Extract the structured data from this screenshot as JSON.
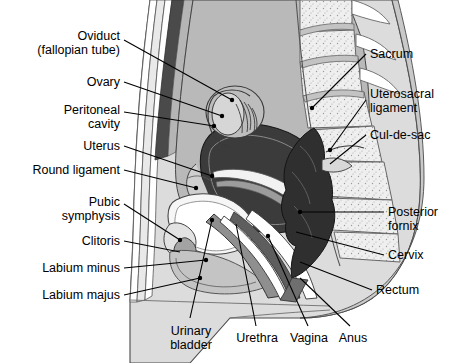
{
  "figure": {
    "type": "anatomical-diagram",
    "style": "grayscale line illustration with leader lines",
    "background_color": "#ffffff",
    "line_color": "#000000",
    "width": 463,
    "height": 363
  },
  "labels": {
    "left": [
      {
        "id": "oviduct",
        "text": "Oviduct\n(fallopian tube)",
        "align": "right",
        "x": 8,
        "y": 30,
        "w": 112
      },
      {
        "id": "ovary",
        "text": "Ovary",
        "align": "right",
        "x": 8,
        "y": 76,
        "w": 112
      },
      {
        "id": "peritoneal-cavity",
        "text": "Peritoneal\ncavity",
        "align": "right",
        "x": 8,
        "y": 104,
        "w": 112
      },
      {
        "id": "uterus",
        "text": "Uterus",
        "align": "right",
        "x": 8,
        "y": 140,
        "w": 112
      },
      {
        "id": "round-ligament",
        "text": "Round ligament",
        "align": "right",
        "x": 4,
        "y": 164,
        "w": 116
      },
      {
        "id": "pubic-symphysis",
        "text": "Pubic\nsymphysis",
        "align": "right",
        "x": 8,
        "y": 196,
        "w": 112
      },
      {
        "id": "clitoris",
        "text": "Clitoris",
        "align": "right",
        "x": 8,
        "y": 235,
        "w": 112
      },
      {
        "id": "labium-minus",
        "text": "Labium minus",
        "align": "right",
        "x": 8,
        "y": 262,
        "w": 112
      },
      {
        "id": "labium-majus",
        "text": "Labium majus",
        "align": "right",
        "x": 8,
        "y": 289,
        "w": 112
      }
    ],
    "right": [
      {
        "id": "sacrum",
        "text": "Sacrum",
        "align": "left",
        "x": 370,
        "y": 48,
        "w": 92
      },
      {
        "id": "uterosacral-ligament",
        "text": "Uterosacral\nligament",
        "align": "left",
        "x": 370,
        "y": 88,
        "w": 92
      },
      {
        "id": "cul-de-sac",
        "text": "Cul-de-sac",
        "align": "left",
        "x": 370,
        "y": 129,
        "w": 92
      },
      {
        "id": "posterior-fornix",
        "text": "Posterior\nfornix",
        "align": "left",
        "x": 388,
        "y": 206,
        "w": 74
      },
      {
        "id": "cervix",
        "text": "Cervix",
        "align": "left",
        "x": 388,
        "y": 249,
        "w": 74
      },
      {
        "id": "rectum",
        "text": "Rectum",
        "align": "left",
        "x": 376,
        "y": 284,
        "w": 86
      }
    ],
    "bottom": [
      {
        "id": "urinary-bladder",
        "text": "Urinary\nbladder",
        "align": "center",
        "x": 160,
        "y": 325,
        "w": 62
      },
      {
        "id": "urethra",
        "text": "Urethra",
        "align": "center",
        "x": 232,
        "y": 332,
        "w": 50
      },
      {
        "id": "vagina",
        "text": "Vagina",
        "align": "center",
        "x": 285,
        "y": 332,
        "w": 48
      },
      {
        "id": "anus",
        "text": "Anus",
        "align": "center",
        "x": 333,
        "y": 332,
        "w": 40
      }
    ]
  },
  "palette": {
    "skin_outer": "#dcdcdc",
    "skin_mid": "#c9c9c9",
    "muscle_dark": "#4a4a4a",
    "peritoneum_fill": "#b9b9b9",
    "bone_fill": "#efefef",
    "bladder_fill": "#f6f6f6",
    "uterus_dark": "#3b3b3b",
    "rectum_dark": "#2f2f2f",
    "vagina_mid": "#8f8f8f",
    "tissue_light": "#e6e6e6",
    "white": "#ffffff"
  }
}
